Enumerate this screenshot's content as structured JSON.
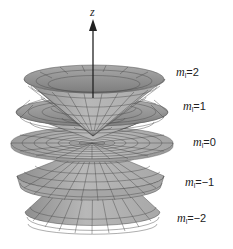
{
  "diagram": {
    "axis": {
      "label": "z"
    },
    "colors": {
      "surface": "#b3b3b3",
      "surface_dark": "#8c8c8c",
      "surface_inner": "#a0a0a0",
      "grid": "#4a4a4a",
      "axis": "#222222",
      "shadow": "#1a1a1a"
    },
    "cones": [
      {
        "m_symbol": "m",
        "sub": "l",
        "eq": "=2",
        "value": 2
      },
      {
        "m_symbol": "m",
        "sub": "l",
        "eq": "=1",
        "value": 1
      },
      {
        "m_symbol": "m",
        "sub": "l",
        "eq": "=0",
        "value": 0
      },
      {
        "m_symbol": "m",
        "sub": "l",
        "eq": "=−1",
        "value": -1
      },
      {
        "m_symbol": "m",
        "sub": "l",
        "eq": "=−2",
        "value": -2
      }
    ]
  }
}
